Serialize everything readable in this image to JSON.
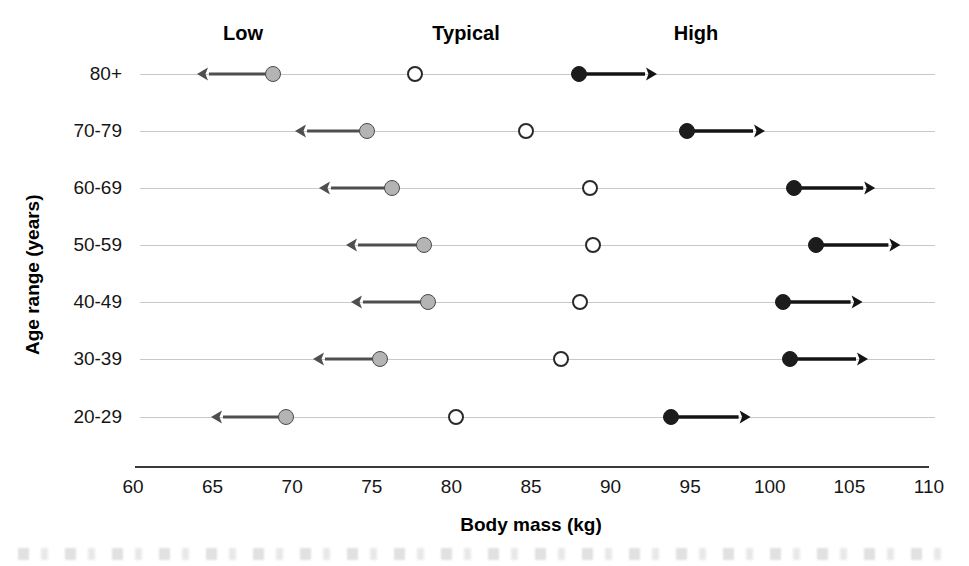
{
  "chart_data": {
    "type": "scatter",
    "title": "",
    "xlabel": "Body mass (kg)",
    "ylabel": "Age range (years)",
    "xlim": [
      60,
      110
    ],
    "xticks": [
      60,
      65,
      70,
      75,
      80,
      85,
      90,
      95,
      100,
      105,
      110
    ],
    "xtick_labels": [
      "60",
      "65",
      "70",
      "75",
      "80",
      "85",
      "90",
      "95",
      "100",
      "105",
      "110"
    ],
    "grid": false,
    "legend_position": "top",
    "column_headers": [
      "Low",
      "Typical",
      "High"
    ],
    "categories": [
      "80+",
      "70-79",
      "60-69",
      "50-59",
      "40-49",
      "30-39",
      "20-29"
    ],
    "series": [
      {
        "name": "Low",
        "marker": "filled-gray-circle",
        "arrow": "left",
        "values": [
          68.8,
          74.7,
          76.3,
          78.3,
          78.5,
          75.5,
          69.6
        ]
      },
      {
        "name": "Typical",
        "marker": "open-circle",
        "arrow": "none",
        "values": [
          77.7,
          84.7,
          88.7,
          88.9,
          88.1,
          86.9,
          80.3
        ]
      },
      {
        "name": "High",
        "marker": "filled-black-circle",
        "arrow": "right",
        "values": [
          88.0,
          94.8,
          101.5,
          102.9,
          100.8,
          101.3,
          93.8
        ]
      }
    ],
    "arrow_lengths_kg": {
      "low": [
        4.8,
        4.5,
        4.6,
        4.9,
        4.8,
        4.2,
        4.7
      ],
      "high": [
        4.9,
        4.9,
        5.1,
        5.3,
        5.0,
        4.9,
        5.0
      ]
    },
    "colors": {
      "low_marker_fill": "#b4b4b4",
      "low_marker_edge": "#4a4a4a",
      "typical_marker_fill": "#ffffff",
      "typical_marker_edge": "#2a2a2a",
      "high_marker_fill": "#1c1c1c",
      "row_line": "#c8c8c8",
      "axis": "#3a3a3a",
      "text": "#161616",
      "background": "#ffffff"
    }
  }
}
